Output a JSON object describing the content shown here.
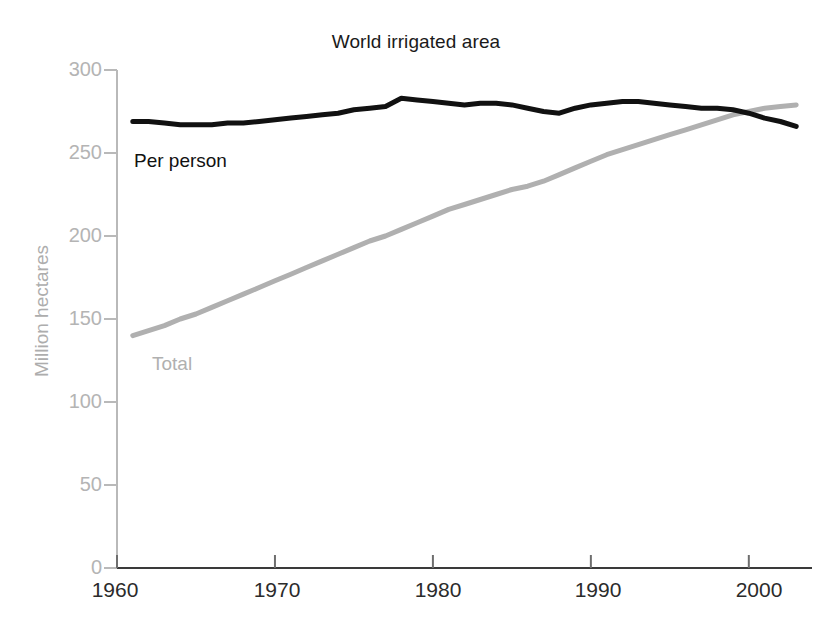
{
  "chart_data": {
    "type": "line",
    "title": "World irrigated area",
    "xlabel": "",
    "ylabel": "Million hectares",
    "xlim": [
      1960,
      2004
    ],
    "ylim": [
      0,
      300
    ],
    "grid": false,
    "legend_position": "inline-annotations",
    "xticks": [
      1960,
      1970,
      1980,
      1990,
      2000
    ],
    "yticks": [
      0,
      50,
      100,
      150,
      200,
      250,
      300
    ],
    "x": [
      1961,
      1962,
      1963,
      1964,
      1965,
      1966,
      1967,
      1968,
      1969,
      1970,
      1971,
      1972,
      1973,
      1974,
      1975,
      1976,
      1977,
      1978,
      1979,
      1980,
      1981,
      1982,
      1983,
      1984,
      1985,
      1986,
      1987,
      1988,
      1989,
      1990,
      1991,
      1992,
      1993,
      1994,
      1995,
      1996,
      1997,
      1998,
      1999,
      2000,
      2001,
      2002,
      2003
    ],
    "series": [
      {
        "name": "Per person",
        "units": "hectares per thousand people",
        "color": "#111111",
        "values": [
          269,
          269,
          268,
          267,
          267,
          267,
          268,
          268,
          269,
          270,
          271,
          272,
          273,
          274,
          276,
          277,
          278,
          283,
          282,
          281,
          280,
          279,
          280,
          280,
          279,
          277,
          275,
          274,
          277,
          279,
          280,
          281,
          281,
          280,
          279,
          278,
          277,
          277,
          276,
          274,
          271,
          269,
          266
        ]
      },
      {
        "name": "Total",
        "units": "million hectares",
        "color": "#b0b0b0",
        "values": [
          140,
          143,
          146,
          150,
          153,
          157,
          161,
          165,
          169,
          173,
          177,
          181,
          185,
          189,
          193,
          197,
          200,
          204,
          208,
          212,
          216,
          219,
          222,
          225,
          228,
          230,
          233,
          237,
          241,
          245,
          249,
          252,
          255,
          258,
          261,
          264,
          267,
          270,
          273,
          275,
          277,
          278,
          279
        ]
      }
    ],
    "annotations": [
      {
        "text": "Per person",
        "x": 1964.5,
        "y": 252,
        "color": "#111111"
      },
      {
        "text": "Total",
        "x": 1964.5,
        "y": 138,
        "color": "#b0b0b0"
      }
    ]
  },
  "axes": {
    "y_tick_labels": [
      "300",
      "250",
      "200",
      "150",
      "100",
      "50",
      "0"
    ],
    "x_tick_labels": [
      "1960",
      "1970",
      "1980",
      "1990",
      "2000"
    ],
    "y_axis_title": "Million hectares"
  },
  "title": "World irrigated area",
  "labels": {
    "per_person": "Per person",
    "total": "Total"
  },
  "colors": {
    "per_person_line": "#111111",
    "total_line": "#b0b0b0",
    "axis": "#555555",
    "tick_label": "#b4b4b4",
    "background": "#ffffff"
  }
}
